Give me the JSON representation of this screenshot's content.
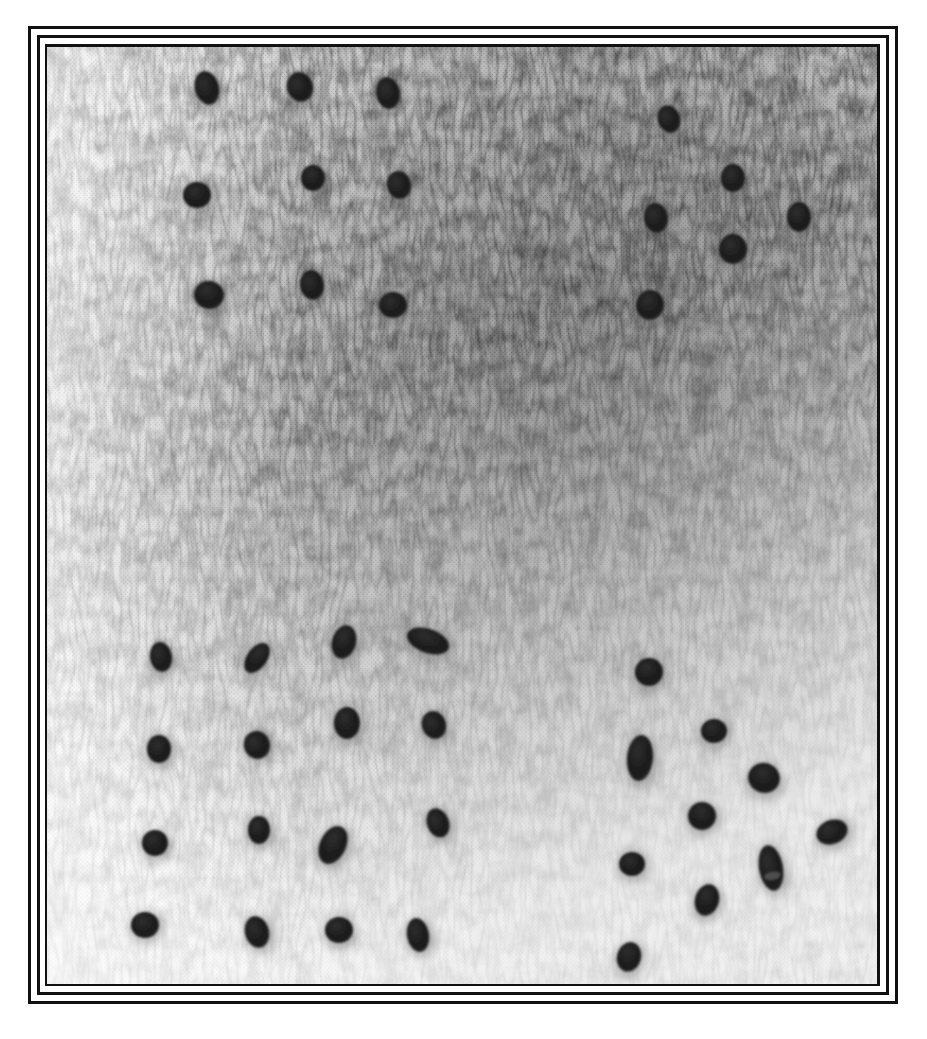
{
  "canvas": {
    "width": 927,
    "height": 1039,
    "background": "#ffffff"
  },
  "frame": {
    "color": "#111111",
    "line_width": 3,
    "lines": [
      {
        "name": "outer",
        "left": 28,
        "top": 26,
        "right": 898,
        "bottom": 1004
      },
      {
        "name": "middle",
        "left": 37,
        "top": 35,
        "right": 889,
        "bottom": 995
      },
      {
        "name": "inner",
        "left": 45,
        "top": 44,
        "right": 880,
        "bottom": 986
      }
    ]
  },
  "photo": {
    "left": 47,
    "top": 47,
    "width": 830,
    "height": 937,
    "subject": "dark seeds arranged in four groups on a textured halftone paper surface",
    "tones": {
      "light": "#f4f4f4",
      "mid": "#b9b9b9",
      "dark": "#8f8f8f",
      "seed": "#1c1c1c",
      "seed_highlight": "#5a5a5a"
    }
  },
  "seeds": [
    {
      "group": "top-left",
      "cx": 207,
      "cy": 88,
      "rx": 12,
      "ry": 17,
      "rot": -15
    },
    {
      "group": "top-left",
      "cx": 300,
      "cy": 87,
      "rx": 13,
      "ry": 15,
      "rot": -20
    },
    {
      "group": "top-left",
      "cx": 388,
      "cy": 93,
      "rx": 12,
      "ry": 16,
      "rot": -10
    },
    {
      "group": "top-left",
      "cx": 197,
      "cy": 195,
      "rx": 14,
      "ry": 13,
      "rot": 0
    },
    {
      "group": "top-left",
      "cx": 313,
      "cy": 178,
      "rx": 12,
      "ry": 13,
      "rot": 0
    },
    {
      "group": "top-left",
      "cx": 399,
      "cy": 185,
      "rx": 12,
      "ry": 14,
      "rot": -15
    },
    {
      "group": "top-left",
      "cx": 209,
      "cy": 295,
      "rx": 15,
      "ry": 14,
      "rot": 10
    },
    {
      "group": "top-left",
      "cx": 312,
      "cy": 285,
      "rx": 12,
      "ry": 15,
      "rot": -10
    },
    {
      "group": "top-left",
      "cx": 393,
      "cy": 305,
      "rx": 14,
      "ry": 13,
      "rot": 0
    },
    {
      "group": "top-right",
      "cx": 669,
      "cy": 119,
      "rx": 11,
      "ry": 14,
      "rot": -20
    },
    {
      "group": "top-right",
      "cx": 733,
      "cy": 178,
      "rx": 12,
      "ry": 14,
      "rot": 0
    },
    {
      "group": "top-right",
      "cx": 656,
      "cy": 218,
      "rx": 12,
      "ry": 15,
      "rot": -10
    },
    {
      "group": "top-right",
      "cx": 799,
      "cy": 217,
      "rx": 12,
      "ry": 15,
      "rot": 0
    },
    {
      "group": "top-right",
      "cx": 733,
      "cy": 249,
      "rx": 14,
      "ry": 15,
      "rot": 0
    },
    {
      "group": "top-right",
      "cx": 650,
      "cy": 305,
      "rx": 14,
      "ry": 15,
      "rot": 10
    },
    {
      "group": "bottom-left",
      "cx": 161,
      "cy": 657,
      "rx": 11,
      "ry": 15,
      "rot": -10
    },
    {
      "group": "bottom-left",
      "cx": 257,
      "cy": 658,
      "rx": 10,
      "ry": 17,
      "rot": 35
    },
    {
      "group": "bottom-left",
      "cx": 344,
      "cy": 642,
      "rx": 12,
      "ry": 17,
      "rot": 15
    },
    {
      "group": "bottom-left",
      "cx": 428,
      "cy": 641,
      "rx": 22,
      "ry": 12,
      "rot": 20
    },
    {
      "group": "bottom-left",
      "cx": 159,
      "cy": 749,
      "rx": 12,
      "ry": 14,
      "rot": 0
    },
    {
      "group": "bottom-left",
      "cx": 257,
      "cy": 745,
      "rx": 13,
      "ry": 14,
      "rot": -20
    },
    {
      "group": "bottom-left",
      "cx": 347,
      "cy": 723,
      "rx": 13,
      "ry": 16,
      "rot": 0
    },
    {
      "group": "bottom-left",
      "cx": 434,
      "cy": 725,
      "rx": 12,
      "ry": 14,
      "rot": -20
    },
    {
      "group": "bottom-left",
      "cx": 155,
      "cy": 843,
      "rx": 13,
      "ry": 13,
      "rot": 0
    },
    {
      "group": "bottom-left",
      "cx": 259,
      "cy": 830,
      "rx": 11,
      "ry": 14,
      "rot": 0
    },
    {
      "group": "bottom-left",
      "cx": 333,
      "cy": 845,
      "rx": 13,
      "ry": 20,
      "rot": 25
    },
    {
      "group": "bottom-left",
      "cx": 438,
      "cy": 823,
      "rx": 11,
      "ry": 15,
      "rot": -20
    },
    {
      "group": "bottom-left",
      "cx": 145,
      "cy": 925,
      "rx": 14,
      "ry": 13,
      "rot": 0
    },
    {
      "group": "bottom-left",
      "cx": 257,
      "cy": 932,
      "rx": 12,
      "ry": 16,
      "rot": -15
    },
    {
      "group": "bottom-left",
      "cx": 339,
      "cy": 930,
      "rx": 14,
      "ry": 13,
      "rot": 0
    },
    {
      "group": "bottom-left",
      "cx": 418,
      "cy": 935,
      "rx": 11,
      "ry": 17,
      "rot": -10
    },
    {
      "group": "bottom-right",
      "cx": 649,
      "cy": 672,
      "rx": 14,
      "ry": 14,
      "rot": 0
    },
    {
      "group": "bottom-right",
      "cx": 714,
      "cy": 731,
      "rx": 13,
      "ry": 12,
      "rot": 0
    },
    {
      "group": "bottom-right",
      "cx": 640,
      "cy": 758,
      "rx": 13,
      "ry": 23,
      "rot": 5
    },
    {
      "group": "bottom-right",
      "cx": 764,
      "cy": 778,
      "rx": 16,
      "ry": 15,
      "rot": 20
    },
    {
      "group": "bottom-right",
      "cx": 702,
      "cy": 816,
      "rx": 14,
      "ry": 14,
      "rot": 20
    },
    {
      "group": "bottom-right",
      "cx": 832,
      "cy": 832,
      "rx": 16,
      "ry": 12,
      "rot": -20
    },
    {
      "group": "bottom-right",
      "cx": 632,
      "cy": 864,
      "rx": 13,
      "ry": 12,
      "rot": 0
    },
    {
      "group": "bottom-right",
      "cx": 771,
      "cy": 868,
      "rx": 12,
      "ry": 23,
      "rot": -10,
      "band": true
    },
    {
      "group": "bottom-right",
      "cx": 707,
      "cy": 900,
      "rx": 12,
      "ry": 16,
      "rot": 15
    },
    {
      "group": "bottom-right",
      "cx": 629,
      "cy": 957,
      "rx": 12,
      "ry": 15,
      "rot": 15
    }
  ]
}
